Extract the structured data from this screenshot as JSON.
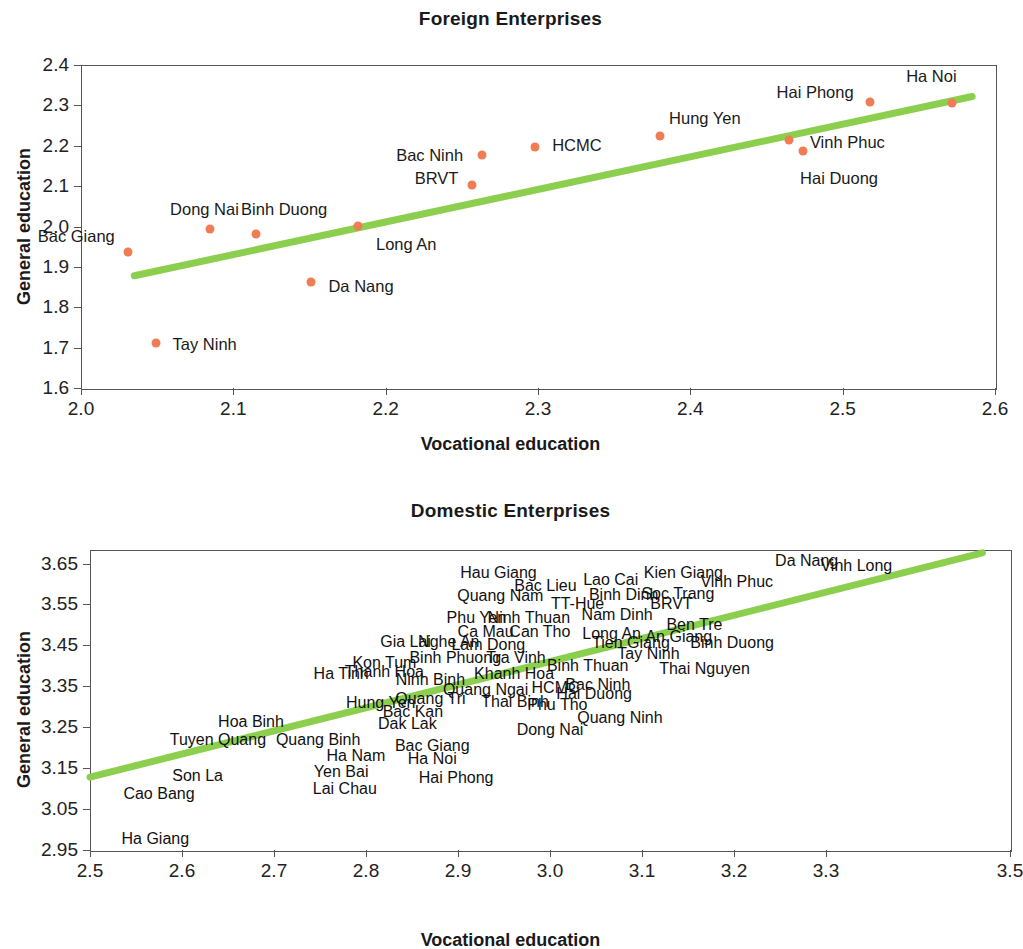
{
  "colors": {
    "marker": "#f07c54",
    "trendline": "#8ccf4e",
    "axis": "#555555",
    "text": "#1a1a1a"
  },
  "charts": {
    "foreign": {
      "title": "Foreign Enterprises",
      "xlabel": "Vocational education",
      "ylabel": "General education",
      "xticks": [
        "2.0",
        "2.1",
        "2.2",
        "2.3",
        "2.4",
        "2.5",
        "2.6"
      ],
      "yticks": [
        "2.4",
        "2.3",
        "2.2",
        "2.1",
        "2.0",
        "1.9",
        "1.8",
        "1.7",
        "1.6"
      ]
    },
    "domestic": {
      "title": "Domestic Enterprises",
      "xlabel": "Vocational education",
      "ylabel": "General education",
      "xticks": [
        "2.5",
        "2.6",
        "2.7",
        "2.8",
        "2.9",
        "3.0",
        "3.1",
        "3.2",
        "3.3",
        "3.5"
      ],
      "yticks": [
        "3.65",
        "3.55",
        "3.45",
        "3.35",
        "3.25",
        "3.15",
        "3.05",
        "2.95"
      ]
    }
  },
  "chart_data": [
    {
      "type": "scatter",
      "title": "Foreign Enterprises",
      "xlabel": "Vocational education",
      "ylabel": "General education",
      "xlim": [
        2.0,
        2.6
      ],
      "ylim": [
        1.6,
        2.4
      ],
      "xtick_values": [
        2.0,
        2.1,
        2.2,
        2.3,
        2.4,
        2.5,
        2.6
      ],
      "ytick_values": [
        1.6,
        1.7,
        1.8,
        1.9,
        2.0,
        2.1,
        2.2,
        2.3,
        2.4
      ],
      "grid": false,
      "legend": "none",
      "markers": true,
      "trendline": {
        "x": [
          2.035,
          2.585
        ],
        "y": [
          1.878,
          2.322
        ]
      },
      "points": [
        {
          "label": "Bac Giang",
          "x": 2.031,
          "y": 1.938,
          "label_dx": -52,
          "label_dy": -16
        },
        {
          "label": "Tay Ninh",
          "x": 2.049,
          "y": 1.712,
          "label_dx": 49,
          "label_dy": 1
        },
        {
          "label": "Dong Nai",
          "x": 2.085,
          "y": 1.995,
          "label_dx": -6,
          "label_dy": -20
        },
        {
          "label": "Binh Duong",
          "x": 2.115,
          "y": 1.982,
          "label_dx": 28,
          "label_dy": -25
        },
        {
          "label": "Da Nang",
          "x": 2.151,
          "y": 1.862,
          "label_dx": 50,
          "label_dy": 4
        },
        {
          "label": "Long An",
          "x": 2.182,
          "y": 2.001,
          "label_dx": 48,
          "label_dy": 18
        },
        {
          "label": "BRVT",
          "x": 2.257,
          "y": 2.104,
          "label_dx": -36,
          "label_dy": -7
        },
        {
          "label": "Bac Ninh",
          "x": 2.263,
          "y": 2.177,
          "label_dx": -52,
          "label_dy": 0
        },
        {
          "label": "HCMC",
          "x": 2.298,
          "y": 2.198,
          "label_dx": 42,
          "label_dy": -2
        },
        {
          "label": "Hung Yen",
          "x": 2.38,
          "y": 2.223,
          "label_dx": 45,
          "label_dy": -18
        },
        {
          "label": "Vinh Phuc",
          "x": 2.465,
          "y": 2.214,
          "label_dx": 58,
          "label_dy": 2
        },
        {
          "label": "Hai Duong",
          "x": 2.474,
          "y": 2.188,
          "label_dx": 36,
          "label_dy": 27
        },
        {
          "label": "Hai Phong",
          "x": 2.518,
          "y": 2.308,
          "label_dx": -55,
          "label_dy": -10
        },
        {
          "label": "Ha Noi",
          "x": 2.572,
          "y": 2.305,
          "label_dx": -21,
          "label_dy": -27
        }
      ]
    },
    {
      "type": "scatter",
      "title": "Domestic Enterprises",
      "xlabel": "Vocational education",
      "ylabel": "General education",
      "xlim": [
        2.5,
        3.5
      ],
      "ylim": [
        2.95,
        3.683
      ],
      "xtick_values": [
        2.5,
        2.6,
        2.7,
        2.8,
        2.9,
        3.0,
        3.1,
        3.2,
        3.3,
        3.5
      ],
      "ytick_values": [
        2.95,
        3.05,
        3.15,
        3.25,
        3.35,
        3.45,
        3.55,
        3.65
      ],
      "grid": false,
      "legend": "none",
      "markers": false,
      "trendline": {
        "x": [
          2.5,
          3.47
        ],
        "y": [
          3.128,
          3.676
        ]
      },
      "points": [
        {
          "label": "Ha Giang",
          "x": 2.571,
          "y": 2.978
        },
        {
          "label": "Cao Bang",
          "x": 2.575,
          "y": 3.086
        },
        {
          "label": "Son La",
          "x": 2.617,
          "y": 3.132
        },
        {
          "label": "Tuyen Quang",
          "x": 2.639,
          "y": 3.219
        },
        {
          "label": "Hoa Binh",
          "x": 2.675,
          "y": 3.262
        },
        {
          "label": "Quang Binh",
          "x": 2.748,
          "y": 3.218
        },
        {
          "label": "Yen Bai",
          "x": 2.773,
          "y": 3.14
        },
        {
          "label": "Lai Chau",
          "x": 2.777,
          "y": 3.098
        },
        {
          "label": "Ha Nam",
          "x": 2.789,
          "y": 3.179
        },
        {
          "label": "Ha Tinh",
          "x": 2.773,
          "y": 3.379
        },
        {
          "label": "Thanh Hoa",
          "x": 2.82,
          "y": 3.386
        },
        {
          "label": "Kon Tum",
          "x": 2.82,
          "y": 3.406
        },
        {
          "label": "Gia Lai",
          "x": 2.843,
          "y": 3.457
        },
        {
          "label": "Hung Yen",
          "x": 2.816,
          "y": 3.31
        },
        {
          "label": "Bac Kan",
          "x": 2.851,
          "y": 3.288
        },
        {
          "label": "Dak Lak",
          "x": 2.845,
          "y": 3.258
        },
        {
          "label": "Quang Tri",
          "x": 2.87,
          "y": 3.318
        },
        {
          "label": "Bac Giang",
          "x": 2.872,
          "y": 3.205
        },
        {
          "label": "Ha Noi",
          "x": 2.872,
          "y": 3.172
        },
        {
          "label": "Ninh Binh",
          "x": 2.87,
          "y": 3.366
        },
        {
          "label": "Nghe An",
          "x": 2.89,
          "y": 3.458
        },
        {
          "label": "Binh Phuong",
          "x": 2.897,
          "y": 3.42
        },
        {
          "label": "Hai Phong",
          "x": 2.898,
          "y": 3.127
        },
        {
          "label": "Quang Ngai",
          "x": 2.93,
          "y": 3.34
        },
        {
          "label": "Lam Dong",
          "x": 2.933,
          "y": 3.452
        },
        {
          "label": "Ca Mau",
          "x": 2.93,
          "y": 3.483
        },
        {
          "label": "Phu Yen",
          "x": 2.92,
          "y": 3.517
        },
        {
          "label": "Quang Nam",
          "x": 2.946,
          "y": 3.57
        },
        {
          "label": "Hau Giang",
          "x": 2.944,
          "y": 3.627
        },
        {
          "label": "Khanh Hoa",
          "x": 2.961,
          "y": 3.381
        },
        {
          "label": "Thai Binh",
          "x": 2.962,
          "y": 3.312
        },
        {
          "label": "Tra Vinh",
          "x": 2.963,
          "y": 3.42
        },
        {
          "label": "Ninh Thuan",
          "x": 2.977,
          "y": 3.518
        },
        {
          "label": "Can Tho",
          "x": 2.989,
          "y": 3.483
        },
        {
          "label": "Bac Lieu",
          "x": 2.995,
          "y": 3.594
        },
        {
          "label": "Dong Nai",
          "x": 3.0,
          "y": 3.242
        },
        {
          "label": "Phu Tho",
          "x": 3.008,
          "y": 3.305
        },
        {
          "label": "HCMC",
          "x": 3.006,
          "y": 3.345
        },
        {
          "label": "TT-Hue",
          "x": 3.03,
          "y": 3.552
        },
        {
          "label": "Binh Thuan",
          "x": 3.041,
          "y": 3.399
        },
        {
          "label": "Hai Duong",
          "x": 3.048,
          "y": 3.33
        },
        {
          "label": "Bac Ninh",
          "x": 3.052,
          "y": 3.354
        },
        {
          "label": "Lao Cai",
          "x": 3.066,
          "y": 3.609
        },
        {
          "label": "Long An",
          "x": 3.067,
          "y": 3.477
        },
        {
          "label": "Nam Dinh",
          "x": 3.073,
          "y": 3.524
        },
        {
          "label": "Binh Dinh",
          "x": 3.08,
          "y": 3.572
        },
        {
          "label": "Quang Ninh",
          "x": 3.076,
          "y": 3.273
        },
        {
          "label": "Tien Giang",
          "x": 3.088,
          "y": 3.455
        },
        {
          "label": "Tay Ninh",
          "x": 3.107,
          "y": 3.43
        },
        {
          "label": "BRVT",
          "x": 3.132,
          "y": 3.55
        },
        {
          "label": "Soc Trang",
          "x": 3.139,
          "y": 3.576
        },
        {
          "label": "An Giang",
          "x": 3.14,
          "y": 3.471
        },
        {
          "label": "Kien Giang",
          "x": 3.145,
          "y": 3.627
        },
        {
          "label": "Ben Tre",
          "x": 3.157,
          "y": 3.5
        },
        {
          "label": "Thai Nguyen",
          "x": 3.168,
          "y": 3.392
        },
        {
          "label": "Binh Duong",
          "x": 3.198,
          "y": 3.456
        },
        {
          "label": "Vinh Phuc",
          "x": 3.203,
          "y": 3.604
        },
        {
          "label": "Da Nang",
          "x": 3.279,
          "y": 3.657
        },
        {
          "label": "Vinh Long",
          "x": 3.333,
          "y": 3.643
        }
      ]
    }
  ]
}
